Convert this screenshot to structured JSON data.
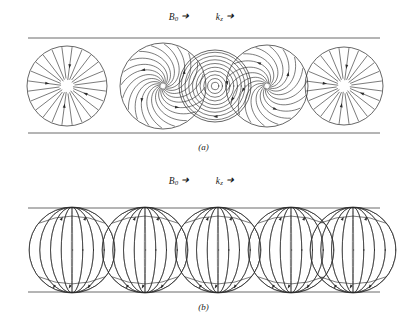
{
  "figure": {
    "background_color": "#ffffff",
    "line_color": "#2b2b2b",
    "width": 407,
    "height": 323
  },
  "panels": [
    {
      "id": "a",
      "caption": "(a)",
      "axis_label": {
        "field_symbol": "B",
        "field_subscript": "0",
        "field_arrow": "➜",
        "wave_symbol": "k",
        "wave_subscript": "z",
        "wave_arrow": "➜"
      },
      "tube": {
        "top_y": 38,
        "bottom_y": 133,
        "left_x": 28,
        "right_x": 380
      },
      "cross_sections": [
        {
          "index": 0,
          "cx": 67,
          "cy": 86,
          "r": 40,
          "pattern": "radial",
          "spokes": 24,
          "arrows": 4
        },
        {
          "index": 1,
          "cx": 163,
          "cy": 86,
          "r": 43,
          "pattern": "spiral",
          "spokes": 20,
          "arrows": 4
        },
        {
          "index": 2,
          "cx": 215,
          "cy": 86,
          "r": 36,
          "pattern": "concentric",
          "spokes": 9,
          "arrows": 3
        },
        {
          "index": 3,
          "cx": 267,
          "cy": 86,
          "r": 41,
          "pattern": "spiral",
          "spokes": 18,
          "arrows": 4
        },
        {
          "index": 4,
          "cx": 344,
          "cy": 86,
          "r": 39,
          "pattern": "radial",
          "spokes": 24,
          "arrows": 4
        }
      ]
    },
    {
      "id": "b",
      "caption": "(b)",
      "axis_label": {
        "field_symbol": "B",
        "field_subscript": "0",
        "field_arrow": "➜",
        "wave_symbol": "k",
        "wave_subscript": "z",
        "wave_arrow": "➜"
      },
      "tube": {
        "top_y": 208,
        "bottom_y": 292,
        "left_x": 28,
        "right_x": 380
      },
      "cross_sections": [
        {
          "index": 0,
          "cx": 72,
          "cy": 250,
          "r": 43,
          "pattern": "meridian",
          "spokes": 9,
          "arrows": 5
        },
        {
          "index": 1,
          "cx": 145,
          "cy": 250,
          "r": 43,
          "pattern": "meridian",
          "spokes": 9,
          "arrows": 5
        },
        {
          "index": 2,
          "cx": 218,
          "cy": 250,
          "r": 43,
          "pattern": "meridian",
          "spokes": 9,
          "arrows": 5
        },
        {
          "index": 3,
          "cx": 291,
          "cy": 250,
          "r": 43,
          "pattern": "meridian",
          "spokes": 9,
          "arrows": 5
        },
        {
          "index": 4,
          "cx": 353,
          "cy": 250,
          "r": 43,
          "pattern": "meridian",
          "spokes": 9,
          "arrows": 5
        }
      ]
    }
  ]
}
